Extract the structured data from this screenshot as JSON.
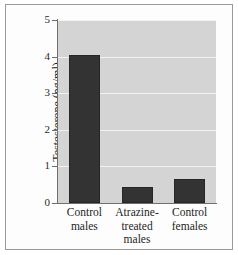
{
  "chart_data": {
    "type": "bar",
    "title": "",
    "xlabel": "",
    "ylabel": "Testosterone (ng/ml)",
    "categories": [
      "Control males",
      "Atrazine-treated males",
      "Control females"
    ],
    "category_lines": [
      [
        "Control",
        "males"
      ],
      [
        "Atrazine-",
        "treated",
        "males"
      ],
      [
        "Control",
        "females"
      ]
    ],
    "values": [
      4.05,
      0.44,
      0.66
    ],
    "ylim": [
      0,
      5
    ],
    "yticks": [
      0,
      1,
      2,
      3,
      4,
      5
    ],
    "ytick_labels": [
      "0",
      "1",
      "2",
      "3",
      "4",
      "5"
    ],
    "grid": true,
    "legend": "none",
    "colors": {
      "bar": "#333333",
      "bar_edge": "#262626",
      "plot_background": "#d4d4d4",
      "gridline": "#f2f2f2",
      "axis": "#6f6f6f",
      "text": "#1d1d1d",
      "frame_border": "#9a9a9a",
      "figure_background": "#fdfdfd"
    }
  }
}
